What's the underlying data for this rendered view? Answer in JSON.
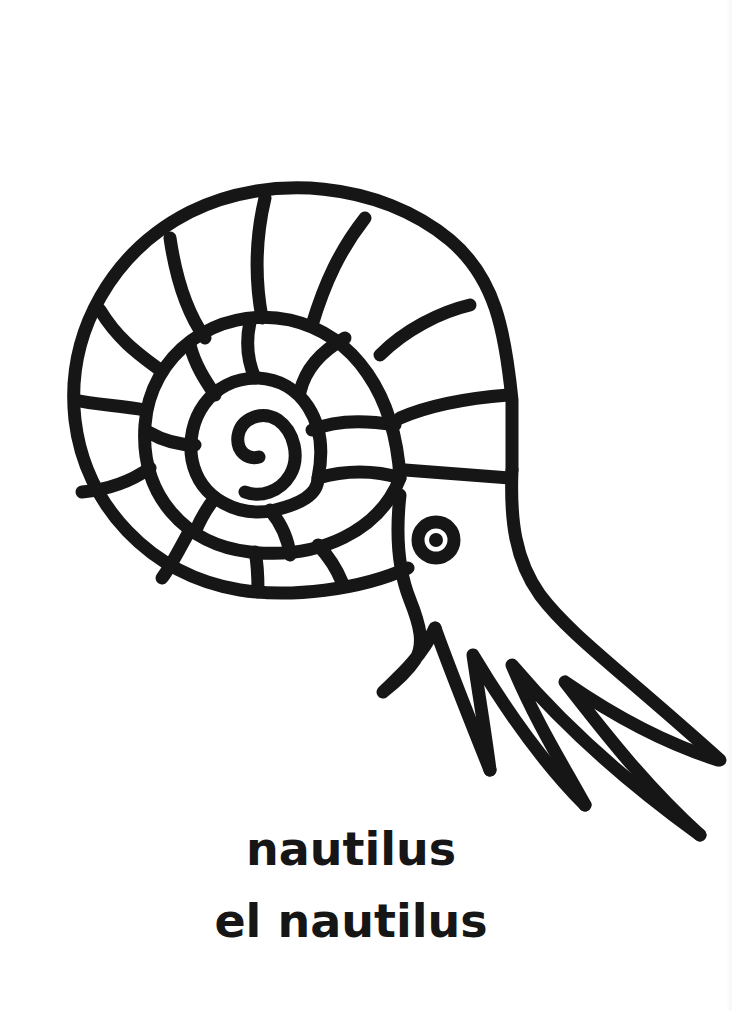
{
  "page": {
    "type": "coloring-page",
    "background_color": "#ffffff",
    "ink_color": "#161616"
  },
  "illustration": {
    "subject": "nautilus",
    "style": "black outline line-art",
    "stroke_width": 13
  },
  "caption": {
    "english": "nautilus",
    "spanish": "el nautilus"
  }
}
